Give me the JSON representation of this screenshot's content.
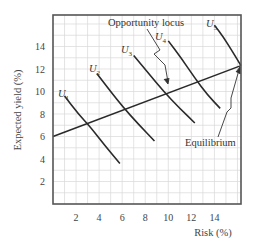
{
  "chart_data": {
    "type": "line",
    "title": "",
    "xlabel": "Risk (%)",
    "ylabel": "Expected yield (%)",
    "xlim": [
      0,
      16.3
    ],
    "ylim": [
      0,
      16.8
    ],
    "xticks": [
      2,
      4,
      6,
      8,
      10,
      12,
      14
    ],
    "yticks": [
      2,
      4,
      6,
      8,
      10,
      12,
      14
    ],
    "grid": true,
    "series": [
      {
        "name": "Opportunity locus",
        "style": "straight",
        "points": [
          [
            0,
            6.0
          ],
          [
            16.3,
            12.3
          ]
        ]
      },
      {
        "name": "U1",
        "style": "indifference curve",
        "points": [
          [
            1.0,
            9.6
          ],
          [
            2.2,
            8.0
          ],
          [
            3.2,
            6.9
          ],
          [
            4.5,
            5.2
          ],
          [
            5.8,
            3.6
          ]
        ]
      },
      {
        "name": "U2",
        "style": "indifference curve",
        "points": [
          [
            3.8,
            11.6
          ],
          [
            5.0,
            10.0
          ],
          [
            6.0,
            8.7
          ],
          [
            7.4,
            7.1
          ],
          [
            8.8,
            5.6
          ]
        ]
      },
      {
        "name": "U3",
        "style": "indifference curve",
        "points": [
          [
            7.0,
            13.2
          ],
          [
            8.3,
            11.6
          ],
          [
            9.6,
            10.0
          ],
          [
            11.0,
            8.5
          ],
          [
            12.3,
            7.2
          ]
        ]
      },
      {
        "name": "U4",
        "style": "indifference curve",
        "points": [
          [
            10.0,
            14.5
          ],
          [
            11.1,
            13.0
          ],
          [
            12.3,
            11.2
          ],
          [
            13.4,
            9.7
          ],
          [
            14.5,
            8.5
          ]
        ]
      },
      {
        "name": "U5",
        "style": "indifference curve",
        "points": [
          [
            14.0,
            15.9
          ],
          [
            14.8,
            14.8
          ],
          [
            15.6,
            13.5
          ],
          [
            16.3,
            12.3
          ]
        ]
      }
    ],
    "annotations": [
      {
        "text": "Opportunity locus",
        "arrow_to": [
          9.7,
          9.8
        ]
      },
      {
        "text": "Equilibrium",
        "arrow_to": [
          16.3,
          12.3
        ]
      }
    ]
  },
  "labels": {
    "ylabel": "Expected yield (%)",
    "xlabel": "Risk (%)",
    "opportunity": "Opportunity locus",
    "equilibrium": "Equilibrium",
    "u": "U",
    "u_subs": [
      "1",
      "2",
      "3",
      "4",
      "5"
    ],
    "xticks": [
      "2",
      "4",
      "6",
      "8",
      "10",
      "12",
      "14"
    ],
    "yticks": [
      "2",
      "4",
      "6",
      "8",
      "10",
      "12",
      "14"
    ]
  }
}
